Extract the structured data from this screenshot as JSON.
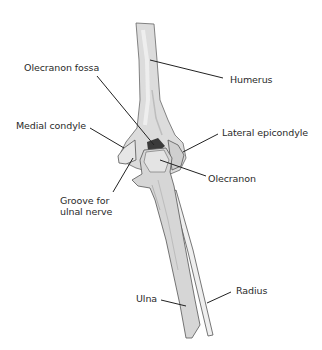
{
  "diagram": {
    "labels": {
      "olecranon_fossa": "Olecranon fossa",
      "humerus": "Humerus",
      "medial_condyle": "Medial condyle",
      "lateral_epicondyle": "Lateral epicondyle",
      "olecranon": "Olecranon",
      "groove_line1": "Groove for",
      "groove_line2": "ulnal nerve",
      "ulna": "Ulna",
      "radius": "Radius"
    },
    "colors": {
      "bone_fill": "#d9d9d9",
      "bone_light": "#ececec",
      "bone_shadow": "#b8b8b8",
      "fossa_dark": "#3a3a3a",
      "outline": "#555555",
      "leader": "#222222"
    }
  }
}
